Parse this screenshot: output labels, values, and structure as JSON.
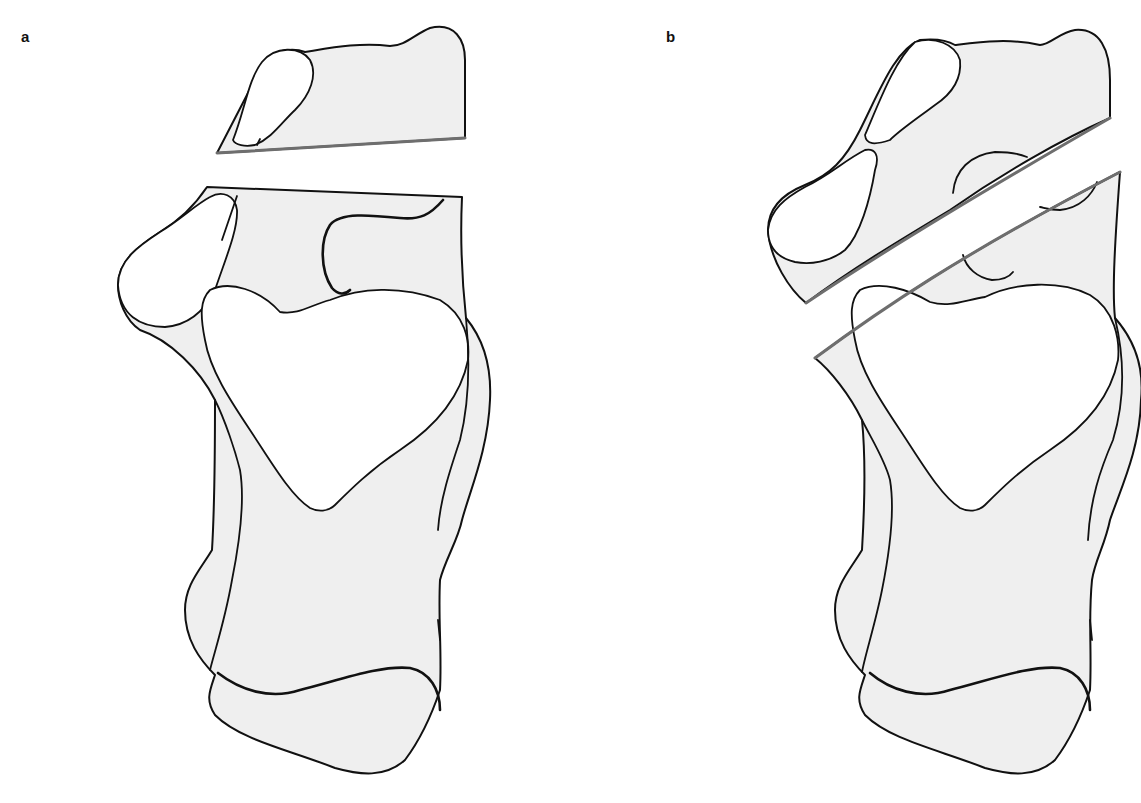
{
  "figure": {
    "colors": {
      "bone_fill": "#efefef",
      "outline": "#111111",
      "cut_line": "#6e6e6e",
      "background": "#ffffff"
    },
    "panels": [
      {
        "label": "a",
        "cut_type": "transverse (horizontal) osteotomy with separated proximal fragment"
      },
      {
        "label": "b",
        "cut_type": "oblique (diagonal) osteotomy with separated fragment"
      }
    ]
  }
}
